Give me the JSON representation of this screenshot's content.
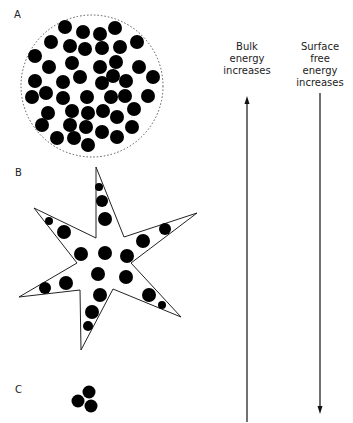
{
  "panels": {
    "a": {
      "label": "A"
    },
    "b": {
      "label": "B"
    },
    "c": {
      "label": "C"
    }
  },
  "arrows": {
    "bulk": {
      "caption": [
        "Bulk",
        "energy",
        "increases"
      ],
      "direction": "up"
    },
    "surface": {
      "caption": [
        "Surface",
        "free",
        "energy",
        "increases"
      ],
      "direction": "down"
    }
  },
  "colors": {
    "particle": "#000000",
    "outline": "#222222",
    "dotted": "#555555"
  }
}
